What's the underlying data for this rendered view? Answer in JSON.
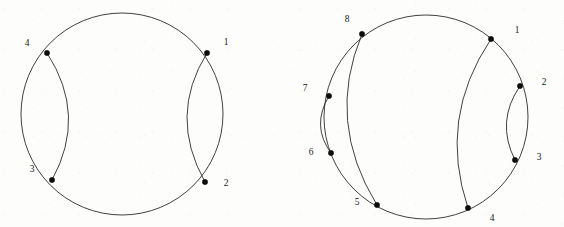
{
  "figure": {
    "background_color": "#fdfdfc",
    "stroke_color": "#2b2b2b",
    "node_color": "#0d0d0d",
    "label_color": "#1a1a1a"
  },
  "chart_data": {
    "type": "diagram",
    "subtype": "non-crossing-chord-diagram",
    "panel_count": 2,
    "panels": [
      {
        "name": "left-diagram",
        "point_count": 4,
        "circle": {
          "cx": 122,
          "cy": 114,
          "r": 101
        },
        "nodes": [
          {
            "id": "1",
            "label": "1",
            "x": 207,
            "y": 53,
            "label_x": 226,
            "label_y": 43
          },
          {
            "id": "2",
            "label": "2",
            "x": 205,
            "y": 182,
            "label_x": 226,
            "label_y": 184
          },
          {
            "id": "3",
            "label": "3",
            "x": 52,
            "y": 180,
            "label_x": 32,
            "label_y": 170
          },
          {
            "id": "4",
            "label": "4",
            "x": 47,
            "y": 53,
            "label_x": 27,
            "label_y": 44
          }
        ],
        "chords": [
          {
            "from": "1",
            "to": "2",
            "bulge": 38
          },
          {
            "from": "3",
            "to": "4",
            "bulge": 38
          }
        ]
      },
      {
        "name": "right-diagram",
        "point_count": 8,
        "circle": {
          "cx": 426,
          "cy": 117,
          "r": 102
        },
        "nodes": [
          {
            "id": "1",
            "label": "1",
            "x": 491,
            "y": 39,
            "label_x": 517,
            "label_y": 31
          },
          {
            "id": "2",
            "label": "2",
            "x": 520,
            "y": 86,
            "label_x": 544,
            "label_y": 83
          },
          {
            "id": "3",
            "label": "3",
            "x": 515,
            "y": 160,
            "label_x": 539,
            "label_y": 158
          },
          {
            "id": "4",
            "label": "4",
            "x": 468,
            "y": 208,
            "label_x": 492,
            "label_y": 219
          },
          {
            "id": "5",
            "label": "5",
            "x": 377,
            "y": 205,
            "label_x": 357,
            "label_y": 203
          },
          {
            "id": "6",
            "label": "6",
            "x": 331,
            "y": 153,
            "label_x": 311,
            "label_y": 153
          },
          {
            "id": "7",
            "label": "7",
            "x": 329,
            "y": 96,
            "label_x": 305,
            "label_y": 89
          },
          {
            "id": "8",
            "label": "8",
            "x": 362,
            "y": 34,
            "label_x": 347,
            "label_y": 20
          }
        ],
        "chords": [
          {
            "from": "1",
            "to": "4",
            "bulge": 42
          },
          {
            "from": "2",
            "to": "3",
            "bulge": 22
          },
          {
            "from": "8",
            "to": "5",
            "bulge": -44
          },
          {
            "from": "7",
            "to": "6",
            "bulge": -19
          }
        ]
      }
    ]
  }
}
